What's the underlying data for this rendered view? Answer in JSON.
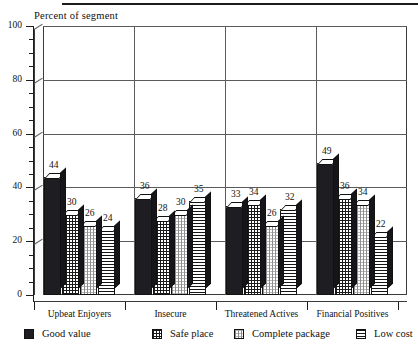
{
  "chart_data": {
    "type": "bar",
    "title": "",
    "ylabel": "Percent of segment",
    "xlabel": "",
    "ylim": [
      0,
      100
    ],
    "ytick_step": 20,
    "yminor_step": 5,
    "grid": true,
    "legend_position": "bottom",
    "yticks": [
      "0",
      "20",
      "40",
      "60",
      "80",
      "100"
    ],
    "categories": [
      "Upbeat Enjoyers",
      "Insecure",
      "Threatened Actives",
      "Financial Positives"
    ],
    "series": [
      {
        "name": "Good value",
        "pattern": "solid",
        "values": [
          44,
          36,
          33,
          49
        ]
      },
      {
        "name": "Safe place",
        "pattern": "grid",
        "values": [
          30,
          28,
          34,
          36
        ]
      },
      {
        "name": "Complete package",
        "pattern": "dots",
        "values": [
          26,
          30,
          26,
          34
        ]
      },
      {
        "name": "Low cost",
        "pattern": "hlines",
        "values": [
          24,
          35,
          32,
          22
        ]
      }
    ]
  },
  "legend": {
    "items": [
      {
        "label": "Good value"
      },
      {
        "label": "Safe place"
      },
      {
        "label": "Complete package"
      },
      {
        "label": "Low cost"
      }
    ]
  }
}
